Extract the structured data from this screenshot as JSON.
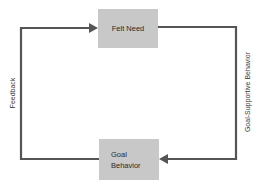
{
  "diagram": {
    "nodes": [
      {
        "id": "felt-need",
        "label": "Felt Need"
      },
      {
        "id": "goal-behavior",
        "label_line1": "Goal",
        "label_line2": "Behavior"
      }
    ],
    "edges": [
      {
        "from": "felt-need",
        "to": "goal-behavior",
        "label": "Goal-Supportive Behavior"
      },
      {
        "from": "goal-behavior",
        "to": "felt-need",
        "label": "Feedback"
      }
    ],
    "colors": {
      "box_fill": "#c8c8c8",
      "line": "#555555",
      "text": "#2a2a2a"
    }
  }
}
